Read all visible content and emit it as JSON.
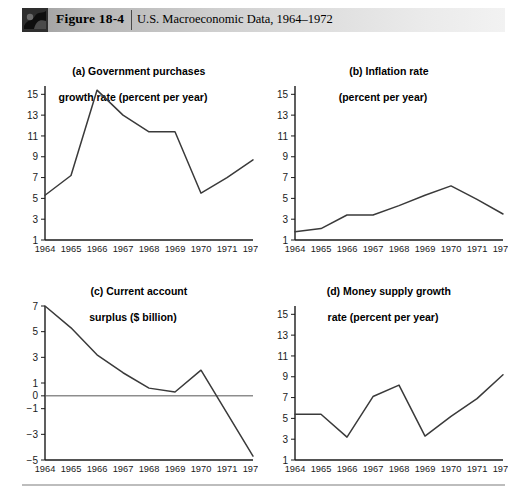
{
  "header": {
    "figure_label": "Figure 18-4",
    "caption": "U.S. Macroeconomic Data, 1964–1972",
    "icon": "book-thumbnail-icon"
  },
  "chart_data": [
    {
      "type": "line",
      "panel": "a",
      "title_line1": "(a) Government purchases",
      "title_line2": "growth rate (percent per year)",
      "xlabel": "",
      "ylabel": "",
      "categories": [
        "1964",
        "1965",
        "1966",
        "1967",
        "1968",
        "1969",
        "1970",
        "1971",
        "1972"
      ],
      "values": [
        5.3,
        7.2,
        15.4,
        13.0,
        11.4,
        11.4,
        5.5,
        7.0,
        8.7
      ],
      "yticks": [
        1,
        3,
        5,
        7,
        9,
        11,
        13,
        15
      ],
      "ylim": [
        1,
        15.8
      ],
      "grid": false,
      "legend": "none",
      "zero_line": false
    },
    {
      "type": "line",
      "panel": "b",
      "title_line1": "(b) Inflation rate",
      "title_line2": "(percent per year)",
      "xlabel": "",
      "ylabel": "",
      "categories": [
        "1964",
        "1965",
        "1966",
        "1967",
        "1968",
        "1969",
        "1970",
        "1971",
        "1972"
      ],
      "values": [
        1.8,
        2.1,
        3.4,
        3.4,
        4.3,
        5.3,
        6.2,
        4.9,
        3.5
      ],
      "yticks": [
        1,
        3,
        5,
        7,
        9,
        11,
        13,
        15
      ],
      "ylim": [
        1,
        15.8
      ],
      "grid": false,
      "legend": "none",
      "zero_line": false
    },
    {
      "type": "line",
      "panel": "c",
      "title_line1": "(c) Current account",
      "title_line2": "surplus ($ billion)",
      "xlabel": "",
      "ylabel": "",
      "categories": [
        "1964",
        "1965",
        "1966",
        "1967",
        "1968",
        "1969",
        "1970",
        "1971",
        "1972"
      ],
      "values": [
        7.0,
        5.3,
        3.2,
        1.8,
        0.6,
        0.3,
        2.0,
        -1.35,
        -4.7
      ],
      "yticks": [
        -5,
        -3,
        -1,
        0,
        1,
        3,
        5,
        7
      ],
      "ytick_labels": [
        "−5",
        "−3",
        "−1",
        "0",
        "1",
        "3",
        "5",
        "7"
      ],
      "ylim": [
        -5,
        7
      ],
      "grid": false,
      "legend": "none",
      "zero_line": true
    },
    {
      "type": "line",
      "panel": "d",
      "title_line1": "(d) Money supply growth",
      "title_line2": "rate (percent per year)",
      "xlabel": "",
      "ylabel": "",
      "categories": [
        "1964",
        "1965",
        "1966",
        "1967",
        "1968",
        "1969",
        "1970",
        "1971",
        "1972"
      ],
      "values": [
        5.4,
        5.4,
        3.2,
        7.1,
        8.2,
        3.3,
        5.2,
        6.9,
        9.2
      ],
      "yticks": [
        1,
        3,
        5,
        7,
        9,
        11,
        13,
        15
      ],
      "ylim": [
        1,
        15.8
      ],
      "grid": false,
      "legend": "none",
      "zero_line": false
    }
  ]
}
